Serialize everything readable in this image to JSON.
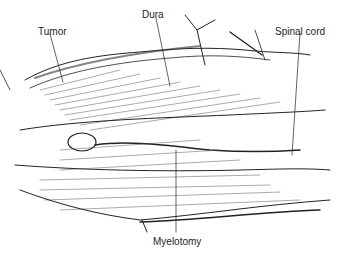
{
  "figure": {
    "labels": {
      "tumor": "Tumor",
      "dura": "Dura",
      "spinal_cord": "Spinal cord",
      "myelotomy": "Myelotomy"
    }
  }
}
